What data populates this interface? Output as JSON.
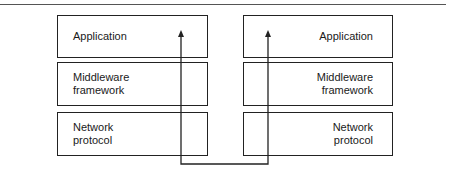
{
  "diagram": {
    "left_stack": [
      {
        "label": "Application"
      },
      {
        "label": "Middleware\nframework"
      },
      {
        "label": "Network\nprotocol"
      }
    ],
    "right_stack": [
      {
        "label": "Application"
      },
      {
        "label": "Middleware\nframework"
      },
      {
        "label": "Network\nprotocol"
      }
    ],
    "connector": {
      "type": "arrow-path",
      "description": "Path from left application down through stack, across bottom, up through right stack to right application; arrowheads at both tops",
      "color": "#222222"
    }
  }
}
